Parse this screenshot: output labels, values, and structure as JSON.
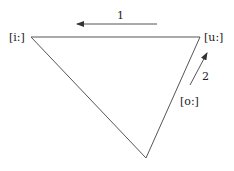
{
  "diagram": {
    "vertices": {
      "front_high": {
        "label": "[i:]"
      },
      "back_high": {
        "label": "[u:]"
      },
      "back_mid": {
        "label": "[o:]"
      }
    },
    "arrows": [
      {
        "label": "1",
        "direction": "left"
      },
      {
        "label": "2",
        "direction": "up-right"
      }
    ],
    "colors": {
      "line": "#555555",
      "text": "#222222"
    }
  }
}
